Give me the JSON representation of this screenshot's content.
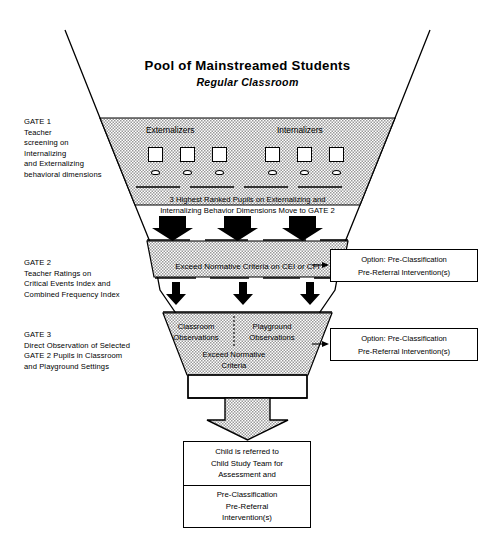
{
  "title": {
    "main": "Pool of Mainstreamed Students",
    "sub": "Regular Classroom"
  },
  "gates": [
    {
      "id": "gate1",
      "lines": [
        "GATE 1",
        "Teacher",
        "screening on",
        "Internalizing",
        "and Externalizing",
        "behavioral dimensions"
      ]
    },
    {
      "id": "gate2",
      "lines": [
        "GATE 2",
        "Teacher Ratings on",
        "Critical Events Index and",
        "Combined Frequency Index"
      ]
    },
    {
      "id": "gate3",
      "lines": [
        "GATE 3",
        "Direct Observation of Selected",
        "GATE 2 Pupils in Classroom",
        "and Playground Settings"
      ]
    }
  ],
  "band1": {
    "group_left": "Externalizers",
    "group_right": "Internalizers",
    "pupil_count_left": 3,
    "pupil_count_right": 3,
    "output_lines": [
      "3 Highest Ranked Pupils on Externalizing and",
      "Internalizing Behavior Dimensions Move to GATE 2"
    ]
  },
  "band2": {
    "caption": "Exceed Normative Criteria on CEI or CFI",
    "arrows_in": 3,
    "arrows_out": 3
  },
  "band3": {
    "left_lines": [
      "Classroom",
      "Observations"
    ],
    "right_lines": [
      "Playground",
      "Observations"
    ],
    "exceed_lines": [
      "Exceed Normative",
      "Criteria"
    ]
  },
  "options": [
    {
      "id": "opt1",
      "line1": "Option: Pre-Classification",
      "line2": "Pre-Referral Intervention(s)"
    },
    {
      "id": "opt2",
      "line1": "Option: Pre-Classification",
      "line2": "Pre-Referral Intervention(s)"
    }
  ],
  "final_box": {
    "top_lines": [
      "Child is referred to",
      "Child Study Team for",
      "Assessment and"
    ],
    "bottom_lines": [
      "Pre-Classification",
      "Pre-Referral",
      "Intervention(s)"
    ]
  },
  "colors": {
    "stroke": "#000000",
    "band_fill": "#c9c9c9",
    "page_bg": "#ffffff",
    "box_fill": "#ffffff",
    "arrow_fill": "#000000",
    "big_arrow_fill": "#c9c9c9"
  }
}
